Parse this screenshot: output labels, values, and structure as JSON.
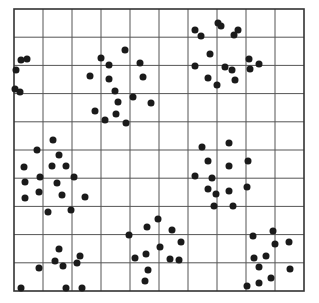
{
  "chart_data": {
    "type": "scatter",
    "title": "",
    "xlabel": "",
    "ylabel": "",
    "grid": true,
    "grid_cells": {
      "columns": 10,
      "rows": 10
    },
    "frame": {
      "left": 14,
      "top": 9,
      "right": 304,
      "bottom": 291
    },
    "colors": {
      "background": "#ffffff",
      "grid": "#555555",
      "point": "#1a1a1a"
    },
    "point_radius": 3.5,
    "note": "Coordinates are in screen pixels within the 319x303 image",
    "clusters": [
      {
        "name": "left-edge",
        "points": [
          [
            21,
            60
          ],
          [
            27,
            59
          ],
          [
            16,
            70
          ],
          [
            15,
            89
          ],
          [
            20,
            92
          ]
        ]
      },
      {
        "name": "upper-middle",
        "points": [
          [
            101,
            58
          ],
          [
            125,
            50
          ],
          [
            109,
            65
          ],
          [
            90,
            76
          ],
          [
            109,
            79
          ],
          [
            140,
            63
          ],
          [
            143,
            77
          ],
          [
            115,
            91
          ],
          [
            133,
            97
          ],
          [
            118,
            102
          ],
          [
            151,
            103
          ],
          [
            95,
            111
          ],
          [
            116,
            114
          ],
          [
            105,
            120
          ],
          [
            126,
            123
          ]
        ]
      },
      {
        "name": "upper-right",
        "points": [
          [
            195,
            30
          ],
          [
            201,
            36
          ],
          [
            218,
            23
          ],
          [
            221,
            26
          ],
          [
            238,
            30
          ],
          [
            234,
            35
          ],
          [
            210,
            54
          ],
          [
            195,
            66
          ],
          [
            225,
            67
          ],
          [
            232,
            70
          ],
          [
            249,
            59
          ],
          [
            250,
            69
          ],
          [
            259,
            64
          ],
          [
            208,
            78
          ],
          [
            235,
            80
          ],
          [
            217,
            85
          ]
        ]
      },
      {
        "name": "middle-left",
        "points": [
          [
            53,
            140
          ],
          [
            37,
            150
          ],
          [
            59,
            155
          ],
          [
            24,
            167
          ],
          [
            52,
            166
          ],
          [
            66,
            166
          ],
          [
            40,
            177
          ],
          [
            74,
            177
          ],
          [
            25,
            182
          ],
          [
            57,
            183
          ],
          [
            39,
            192
          ],
          [
            62,
            195
          ],
          [
            25,
            198
          ],
          [
            85,
            197
          ],
          [
            48,
            212
          ],
          [
            71,
            210
          ]
        ]
      },
      {
        "name": "middle-right",
        "points": [
          [
            202,
            147
          ],
          [
            229,
            143
          ],
          [
            208,
            161
          ],
          [
            229,
            166
          ],
          [
            248,
            161
          ],
          [
            195,
            176
          ],
          [
            212,
            178
          ],
          [
            208,
            189
          ],
          [
            216,
            194
          ],
          [
            229,
            191
          ],
          [
            247,
            187
          ],
          [
            214,
            206
          ],
          [
            233,
            206
          ]
        ]
      },
      {
        "name": "lower-left",
        "points": [
          [
            59,
            249
          ],
          [
            80,
            256
          ],
          [
            55,
            261
          ],
          [
            63,
            266
          ],
          [
            77,
            263
          ],
          [
            39,
            268
          ],
          [
            21,
            288
          ],
          [
            66,
            288
          ],
          [
            82,
            288
          ]
        ]
      },
      {
        "name": "lower-middle",
        "points": [
          [
            129,
            235
          ],
          [
            147,
            227
          ],
          [
            158,
            219
          ],
          [
            172,
            230
          ],
          [
            181,
            242
          ],
          [
            160,
            247
          ],
          [
            135,
            258
          ],
          [
            146,
            254
          ],
          [
            170,
            259
          ],
          [
            179,
            260
          ],
          [
            148,
            270
          ],
          [
            145,
            281
          ]
        ]
      },
      {
        "name": "lower-right",
        "points": [
          [
            253,
            236
          ],
          [
            273,
            231
          ],
          [
            275,
            244
          ],
          [
            289,
            242
          ],
          [
            254,
            258
          ],
          [
            266,
            256
          ],
          [
            259,
            267
          ],
          [
            290,
            269
          ],
          [
            271,
            278
          ],
          [
            259,
            283
          ],
          [
            247,
            286
          ]
        ]
      }
    ]
  }
}
